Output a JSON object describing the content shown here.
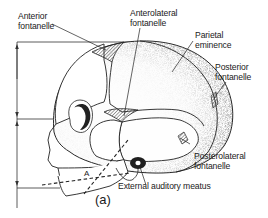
{
  "figure": {
    "caption": "(a)",
    "colors": {
      "line": "#222222",
      "hatch": "#444444",
      "stipple": "#555555",
      "background": "#ffffff"
    },
    "labels": {
      "anterior_fontanelle": [
        "Anterior",
        "fontanelle"
      ],
      "anterolateral_fontanelle": [
        "Anterolateral",
        "fontanelle"
      ],
      "parietal_eminence": [
        "Parietal",
        "eminence"
      ],
      "posterior_fontanelle": [
        "Posterior",
        "fontanelle"
      ],
      "posterolateral_fontanelle": [
        "Posterolateral",
        "fontanelle"
      ],
      "external_auditory_meatus": "External  auditory  meatus",
      "angle_marker": "A"
    }
  }
}
